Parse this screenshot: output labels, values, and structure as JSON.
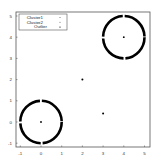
{
  "chart_data": {
    "type": "scatter",
    "title": "",
    "xlabel": "",
    "ylabel": "",
    "xlim": [
      -1.2,
      5.2
    ],
    "ylim": [
      -1.2,
      5.2
    ],
    "xticks": [
      -1,
      0,
      1,
      2,
      3,
      4,
      5
    ],
    "yticks": [
      -1,
      0,
      1,
      2,
      3,
      4,
      5
    ],
    "grid": false,
    "legend_position": "upper left",
    "series": [
      {
        "name": "Cluster1",
        "marker": "dot",
        "color": "#000000",
        "shape": "ring",
        "center": [
          0,
          0
        ],
        "radius": 1,
        "include_center": true
      },
      {
        "name": "Cluster2",
        "marker": "dot",
        "color": "#000000",
        "shape": "ring",
        "center": [
          4,
          4
        ],
        "radius": 1,
        "include_center": true
      },
      {
        "name": "Outlier",
        "marker": "dot",
        "color": "#000000",
        "points": [
          [
            2,
            2
          ],
          [
            3,
            0.4
          ]
        ]
      }
    ]
  },
  "legend": {
    "items": [
      "Cluster1",
      "Cluster2",
      "Outlier"
    ]
  },
  "axes": {
    "x_tick_labels": [
      "-1",
      "0",
      "1",
      "2",
      "3",
      "4",
      "5"
    ],
    "y_tick_labels": [
      "-1",
      "0",
      "1",
      "2",
      "3",
      "4",
      "5"
    ]
  }
}
